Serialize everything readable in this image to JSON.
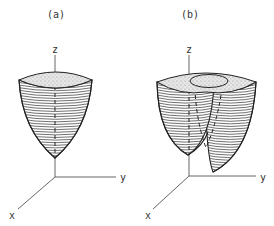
{
  "panels": [
    {
      "id": "a",
      "caption": "(a)",
      "axis_labels": {
        "z": "z",
        "y": "y",
        "x": "x"
      },
      "surface": "single paraboloid bowl"
    },
    {
      "id": "b",
      "caption": "(b)",
      "axis_labels": {
        "z": "z",
        "y": "y",
        "x": "x"
      },
      "surface": "two overlapping paraboloid bowls"
    }
  ]
}
